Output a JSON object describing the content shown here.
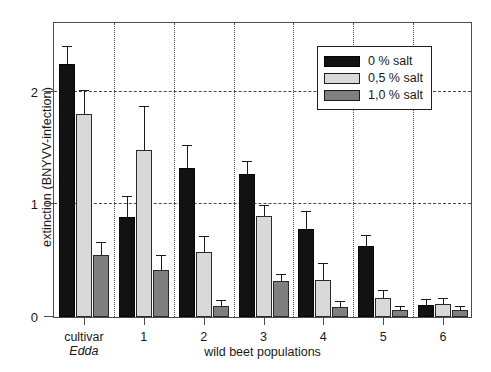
{
  "chart_data": {
    "type": "bar",
    "title": "",
    "xlabel": "wild beet populations",
    "ylabel": "extinction (BNYVV-infection)",
    "categories": [
      "cultivar Edda",
      "1",
      "2",
      "3",
      "4",
      "5",
      "6"
    ],
    "category_labels": [
      {
        "line1": "cultivar",
        "line2": "Edda",
        "italic_line2": true
      },
      {
        "line1": "1",
        "line2": ""
      },
      {
        "line1": "2",
        "line2": ""
      },
      {
        "line1": "3",
        "line2": ""
      },
      {
        "line1": "4",
        "line2": ""
      },
      {
        "line1": "5",
        "line2": ""
      },
      {
        "line1": "6",
        "line2": ""
      }
    ],
    "series": [
      {
        "name": "0 % salt",
        "color": "#121212",
        "values": [
          2.25,
          0.89,
          1.32,
          1.27,
          0.78,
          0.63,
          0.11
        ],
        "errors": [
          0.15,
          0.18,
          0.2,
          0.11,
          0.15,
          0.09,
          0.04
        ]
      },
      {
        "name": "0,5 % salt",
        "color": "#d9d9d9",
        "values": [
          1.8,
          1.48,
          0.58,
          0.9,
          0.33,
          0.17,
          0.12
        ],
        "errors": [
          0.21,
          0.39,
          0.13,
          0.09,
          0.14,
          0.06,
          0.04
        ]
      },
      {
        "name": "1,0 % salt",
        "color": "#7f7f7f",
        "values": [
          0.55,
          0.42,
          0.1,
          0.32,
          0.09,
          0.06,
          0.06
        ],
        "errors": [
          0.11,
          0.12,
          0.04,
          0.05,
          0.04,
          0.03,
          0.03
        ]
      }
    ],
    "ylim": [
      0,
      2.63
    ],
    "yticks": [
      0,
      1,
      2
    ],
    "ytick_labels": [
      "0",
      "1",
      "2"
    ],
    "xlim_groups": 7,
    "grid": {
      "horizontal_dashed_at": [
        1,
        2
      ],
      "vertical_dotted_between_groups": true
    },
    "legend": {
      "position": "top-right",
      "entries": [
        "0 % salt",
        "0,5 % salt",
        "1,0 % salt"
      ]
    }
  }
}
